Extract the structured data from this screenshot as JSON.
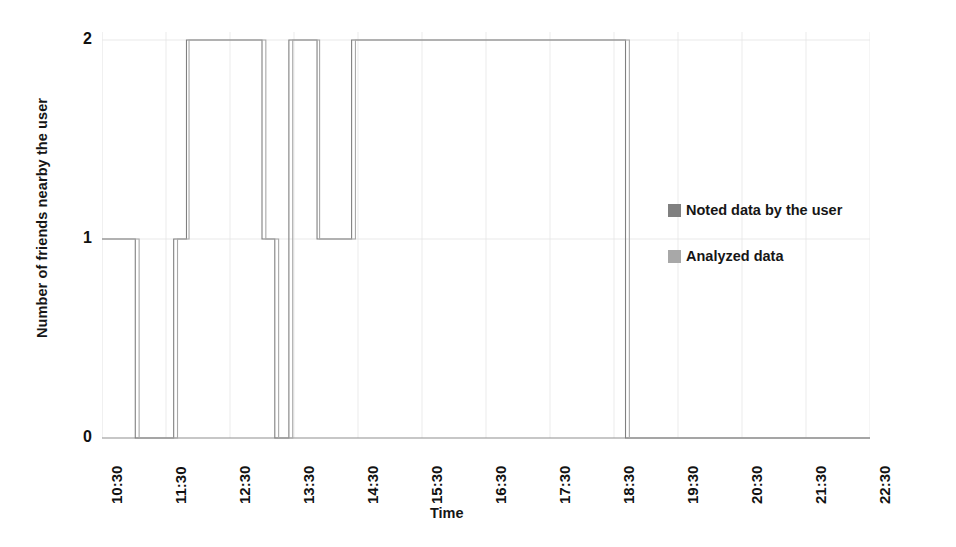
{
  "chart_data": {
    "type": "line",
    "title": "",
    "xlabel": "Time",
    "ylabel": "Number of friends nearby the user",
    "ylim": [
      0,
      2
    ],
    "yticks": [
      "0",
      "1",
      "2"
    ],
    "grid": true,
    "legend_position": "right",
    "x_tick_labels": [
      "10:30",
      "11:30",
      "12:30",
      "13:30",
      "14:30",
      "15:30",
      "16:30",
      "17:30",
      "18:30",
      "19:30",
      "20:30",
      "21:30",
      "22:30"
    ],
    "x_start_hour": 10.5,
    "x_end_hour": 22.5,
    "series": [
      {
        "name": "Noted data by the user",
        "color": "#808080",
        "step_points": [
          [
            10.5,
            1
          ],
          [
            11.02,
            1
          ],
          [
            11.02,
            0
          ],
          [
            11.62,
            0
          ],
          [
            11.62,
            1
          ],
          [
            11.82,
            1
          ],
          [
            11.82,
            2
          ],
          [
            13.0,
            2
          ],
          [
            13.0,
            1
          ],
          [
            13.2,
            1
          ],
          [
            13.2,
            0
          ],
          [
            13.42,
            0
          ],
          [
            13.42,
            2
          ],
          [
            13.86,
            2
          ],
          [
            13.86,
            1
          ],
          [
            14.4,
            1
          ],
          [
            14.4,
            2
          ],
          [
            18.68,
            2
          ],
          [
            18.68,
            0
          ],
          [
            22.5,
            0
          ]
        ]
      },
      {
        "name": "Analyzed data",
        "color": "#a8a8a8",
        "step_points": [
          [
            10.5,
            1
          ],
          [
            11.08,
            1
          ],
          [
            11.08,
            0
          ],
          [
            11.68,
            0
          ],
          [
            11.68,
            1
          ],
          [
            11.86,
            1
          ],
          [
            11.86,
            2
          ],
          [
            13.06,
            2
          ],
          [
            13.06,
            1
          ],
          [
            13.26,
            1
          ],
          [
            13.26,
            0
          ],
          [
            13.48,
            0
          ],
          [
            13.48,
            2
          ],
          [
            13.9,
            2
          ],
          [
            13.9,
            1
          ],
          [
            14.46,
            1
          ],
          [
            14.46,
            2
          ],
          [
            18.74,
            2
          ],
          [
            18.74,
            0
          ],
          [
            22.5,
            0
          ]
        ]
      }
    ]
  },
  "legend": {
    "items": [
      {
        "label": "Noted data by the user",
        "color": "#808080"
      },
      {
        "label": "Analyzed data",
        "color": "#a8a8a8"
      }
    ]
  },
  "axes": {
    "x_title": "Time",
    "y_title": "Number of friends nearby the user"
  },
  "colors": {
    "grid": "#e6e6e6",
    "axis": "#9a9a9a",
    "noted": "#808080",
    "analyzed": "#a8a8a8",
    "text": "#161616"
  }
}
